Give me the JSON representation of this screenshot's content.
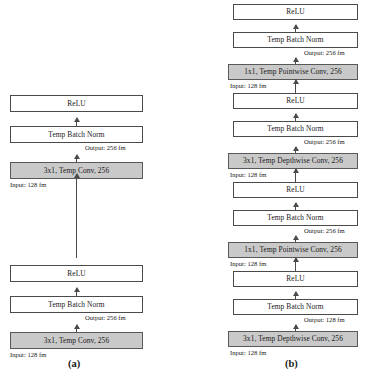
{
  "figure": {
    "panels": [
      {
        "id": "a",
        "caption": "(a)",
        "blocks": [
          {
            "name": "relu-top",
            "label": "ReLU",
            "style": "plain"
          },
          {
            "name": "batchnorm-top",
            "label": "Temp Batch Norm",
            "style": "plain"
          },
          {
            "name": "conv-top",
            "label": "3x1, Temp Conv, 256",
            "style": "conv"
          },
          {
            "name": "relu-bottom",
            "label": "ReLU",
            "style": "plain"
          },
          {
            "name": "batchnorm-bottom",
            "label": "Temp Batch Norm",
            "style": "plain"
          },
          {
            "name": "conv-bottom",
            "label": "3x1, Temp Conv, 256",
            "style": "conv"
          }
        ],
        "notes": [
          {
            "name": "output-note-top",
            "label": "Output: 256 fm"
          },
          {
            "name": "input-note-top",
            "label": "Input: 128 fm"
          },
          {
            "name": "output-note-bottom",
            "label": "Output: 256 fm"
          },
          {
            "name": "input-note-bottom",
            "label": "Input: 128 fm"
          }
        ]
      },
      {
        "id": "b",
        "caption": "(b)",
        "blocks": [
          {
            "name": "relu-4",
            "label": "ReLU",
            "style": "plain"
          },
          {
            "name": "batchnorm-4",
            "label": "Temp Batch Norm",
            "style": "plain"
          },
          {
            "name": "pointwise-2",
            "label": "1x1, Temp Pointwise Conv, 256",
            "style": "conv"
          },
          {
            "name": "relu-3",
            "label": "ReLU",
            "style": "plain"
          },
          {
            "name": "batchnorm-3",
            "label": "Temp Batch Norm",
            "style": "plain"
          },
          {
            "name": "depthwise-2",
            "label": "3x1, Temp Depthwise Conv, 256",
            "style": "conv"
          },
          {
            "name": "relu-2",
            "label": "ReLU",
            "style": "plain"
          },
          {
            "name": "batchnorm-2",
            "label": "Temp Batch Norm",
            "style": "plain"
          },
          {
            "name": "pointwise-1",
            "label": "1x1, Temp Pointwise Conv, 256",
            "style": "conv"
          },
          {
            "name": "relu-1",
            "label": "ReLU",
            "style": "plain"
          },
          {
            "name": "batchnorm-1",
            "label": "Temp Batch Norm",
            "style": "plain"
          },
          {
            "name": "depthwise-1",
            "label": "3x1, Temp Depthwise Conv, 256",
            "style": "conv"
          }
        ],
        "notes": [
          {
            "name": "output-note-4",
            "label": "Output: 256 fm"
          },
          {
            "name": "input-note-4",
            "label": "Input: 128 fm"
          },
          {
            "name": "output-note-3",
            "label": "Output: 256 fm"
          },
          {
            "name": "input-note-3",
            "label": "Input: 128 fm"
          },
          {
            "name": "output-note-2",
            "label": "Output: 256 fm"
          },
          {
            "name": "input-note-2",
            "label": "Input: 128 fm"
          },
          {
            "name": "output-note-1",
            "label": "Output: 128 fm"
          },
          {
            "name": "input-note-1",
            "label": "Input: 128 fm"
          }
        ]
      }
    ],
    "colors": {
      "conv_fill": "#c9c9c9",
      "box_border": "#4a4a4a",
      "arrow": "#4a4a4a",
      "background": "#ffffff",
      "text": "#1a1a1a"
    }
  }
}
